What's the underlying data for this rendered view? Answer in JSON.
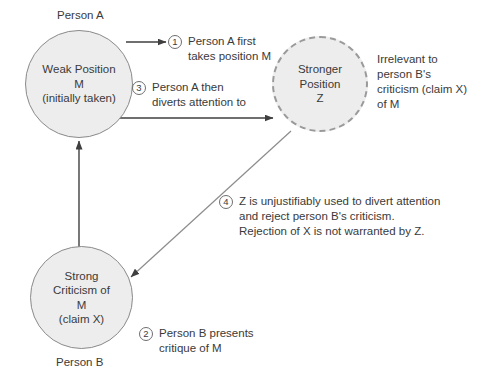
{
  "diagram": {
    "colors": {
      "node_fill": "#ededed",
      "node_stroke": "#8a8a8a",
      "dashed_stroke": "#9a9a9a",
      "text": "#3a3a3a",
      "arrow": "#4a4a4a",
      "background": "#ffffff"
    },
    "nodes": [
      {
        "id": "weak-position-m",
        "label": "Weak Position\nM\n(initially taken)",
        "actor": "Person A",
        "style": "solid"
      },
      {
        "id": "stronger-position-z",
        "label": "Stronger\nPosition\nZ",
        "style": "dashed"
      },
      {
        "id": "strong-criticism-m",
        "label": "Strong\nCriticism of\nM\n(claim X)",
        "actor": "Person B",
        "style": "solid"
      }
    ],
    "side_note": "Irrelevant to\nperson B's\ncriticism (claim X)\nof M",
    "steps": [
      {
        "num": "1",
        "text": "Person A first\ntakes position M"
      },
      {
        "num": "3",
        "text": "Person A then\ndiverts attention to"
      },
      {
        "num": "4",
        "text": "Z is unjustifiably used to divert attention\nand reject person B's criticism.\nRejection of X is not warranted by Z."
      },
      {
        "num": "2",
        "text": "Person B presents\ncritique of M"
      }
    ]
  }
}
